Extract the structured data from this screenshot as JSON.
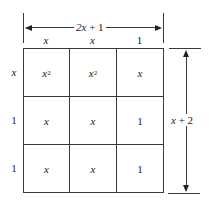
{
  "width_dimension": {
    "label": "2x + 1",
    "label_var": "2x",
    "label_rest": " + 1"
  },
  "height_dimension": {
    "label": "x + 2",
    "label_var": "x",
    "label_rest": " + 2"
  },
  "column_headers": [
    "x",
    "x",
    "1"
  ],
  "row_headers": [
    "x",
    "1",
    "1"
  ],
  "cells": [
    [
      {
        "base": "x",
        "exp": "2"
      },
      {
        "base": "x",
        "exp": "2"
      },
      {
        "base": "x",
        "exp": ""
      }
    ],
    [
      {
        "base": "x",
        "exp": ""
      },
      {
        "base": "x",
        "exp": ""
      },
      {
        "base": "1",
        "exp": ""
      }
    ],
    [
      {
        "base": "x",
        "exp": ""
      },
      {
        "base": "x",
        "exp": ""
      },
      {
        "base": "1",
        "exp": ""
      }
    ]
  ],
  "colors": {
    "line": "#3a3a3a",
    "text": "#222222",
    "background": "#ffffff"
  }
}
